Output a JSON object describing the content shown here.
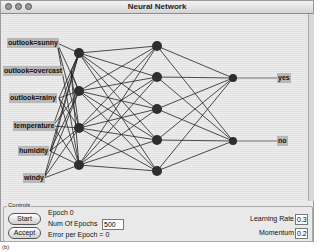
{
  "window": {
    "title": "Neural Network"
  },
  "network": {
    "inputs": [
      {
        "label": "outlook=sunny",
        "x": 6,
        "y": 37
      },
      {
        "label": "outlook=overcast",
        "x": 2,
        "y": 65
      },
      {
        "label": "outlook=rainy",
        "x": 8,
        "y": 92
      },
      {
        "label": "temperature",
        "x": 12,
        "y": 120
      },
      {
        "label": "humidity",
        "x": 17,
        "y": 145
      },
      {
        "label": "windy",
        "x": 22,
        "y": 172
      }
    ],
    "outputs": [
      {
        "label": "yes",
        "x": 276,
        "y": 72
      },
      {
        "label": "no",
        "x": 276,
        "y": 135
      }
    ],
    "hidden1_y": [
      52,
      90,
      127,
      164
    ],
    "hidden2_y": [
      45,
      76,
      108,
      139,
      170
    ],
    "output_node_y": [
      77,
      140
    ]
  },
  "controls": {
    "title": "Controls",
    "start_label": "Start",
    "accept_label": "Accept",
    "epoch_text": "Epoch  0",
    "num_epochs_label": "Num Of Epochs",
    "num_epochs_value": "500",
    "error_text": "Error per Epoch = 0",
    "learning_rate_label": "Learning Rate =",
    "learning_rate_value": "0.3",
    "momentum_label": "Momentum =",
    "momentum_value": "0.2"
  },
  "caption": "(b)"
}
